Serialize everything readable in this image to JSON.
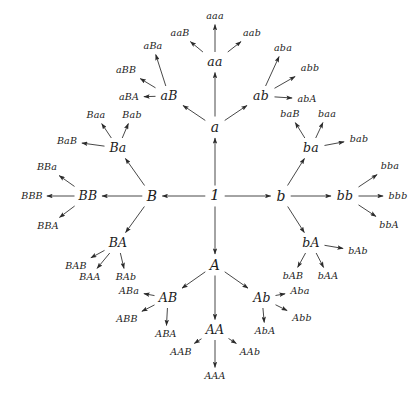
{
  "figure": {
    "type": "cayley-graph-tree",
    "generators": [
      "a",
      "b",
      "A",
      "B"
    ],
    "identity_label": "1",
    "line_color": "#333333",
    "text_color": "#1c1c1c",
    "background": "#ffffff",
    "width": 419,
    "height": 396
  },
  "nodes": [
    {
      "id": "root",
      "label": "1",
      "x": 215,
      "y": 196,
      "gen": 0
    },
    {
      "id": "a",
      "label": "a",
      "x": 215,
      "y": 127,
      "gen": 1
    },
    {
      "id": "b",
      "label": "b",
      "x": 281,
      "y": 196,
      "gen": 1
    },
    {
      "id": "A",
      "label": "A",
      "x": 215,
      "y": 265,
      "gen": 1
    },
    {
      "id": "B",
      "label": "B",
      "x": 152,
      "y": 196,
      "gen": 1
    },
    {
      "id": "aB",
      "label": "aB",
      "x": 169,
      "y": 96,
      "gen": 2
    },
    {
      "id": "aa",
      "label": "aa",
      "x": 215,
      "y": 62,
      "gen": 2
    },
    {
      "id": "ab",
      "label": "ab",
      "x": 261,
      "y": 96,
      "gen": 2
    },
    {
      "id": "ba",
      "label": "ba",
      "x": 311,
      "y": 148,
      "gen": 2
    },
    {
      "id": "bb",
      "label": "bb",
      "x": 345,
      "y": 196,
      "gen": 2
    },
    {
      "id": "bA",
      "label": "bA",
      "x": 311,
      "y": 243,
      "gen": 2
    },
    {
      "id": "AB",
      "label": "AB",
      "x": 168,
      "y": 298,
      "gen": 2
    },
    {
      "id": "AA",
      "label": "AA",
      "x": 215,
      "y": 330,
      "gen": 2
    },
    {
      "id": "Ab",
      "label": "Ab",
      "x": 262,
      "y": 298,
      "gen": 2
    },
    {
      "id": "Ba",
      "label": "Ba",
      "x": 118,
      "y": 148,
      "gen": 2
    },
    {
      "id": "BB",
      "label": "BB",
      "x": 88,
      "y": 196,
      "gen": 2
    },
    {
      "id": "BA",
      "label": "BA",
      "x": 118,
      "y": 243,
      "gen": 2
    },
    {
      "id": "aaB",
      "label": "aaB",
      "x": 180,
      "y": 33,
      "gen": 3
    },
    {
      "id": "aaa",
      "label": "aaa",
      "x": 215,
      "y": 16,
      "gen": 3
    },
    {
      "id": "aab",
      "label": "aab",
      "x": 252,
      "y": 33,
      "gen": 3
    },
    {
      "id": "aBB",
      "label": "aBB",
      "x": 126,
      "y": 70,
      "gen": 3
    },
    {
      "id": "aBa",
      "label": "aBa",
      "x": 153,
      "y": 46,
      "gen": 3
    },
    {
      "id": "aBA",
      "label": "aBA",
      "x": 129,
      "y": 97,
      "gen": 3
    },
    {
      "id": "aba",
      "label": "aba",
      "x": 283,
      "y": 48,
      "gen": 3
    },
    {
      "id": "abb",
      "label": "abb",
      "x": 310,
      "y": 68,
      "gen": 3
    },
    {
      "id": "abA",
      "label": "abA",
      "x": 307,
      "y": 99,
      "gen": 3
    },
    {
      "id": "baB",
      "label": "baB",
      "x": 290,
      "y": 114,
      "gen": 3
    },
    {
      "id": "baa",
      "label": "baa",
      "x": 327,
      "y": 114,
      "gen": 3
    },
    {
      "id": "bab",
      "label": "bab",
      "x": 359,
      "y": 139,
      "gen": 3
    },
    {
      "id": "bba",
      "label": "bba",
      "x": 390,
      "y": 166,
      "gen": 3
    },
    {
      "id": "bbb",
      "label": "bbb",
      "x": 398,
      "y": 196,
      "gen": 3
    },
    {
      "id": "bbA",
      "label": "bbA",
      "x": 389,
      "y": 225,
      "gen": 3
    },
    {
      "id": "bAb",
      "label": "bAb",
      "x": 358,
      "y": 251,
      "gen": 3
    },
    {
      "id": "bAB",
      "label": "bAB",
      "x": 293,
      "y": 276,
      "gen": 3
    },
    {
      "id": "bAA",
      "label": "bAA",
      "x": 328,
      "y": 276,
      "gen": 3
    },
    {
      "id": "Aba",
      "label": "Aba",
      "x": 300,
      "y": 291,
      "gen": 3
    },
    {
      "id": "Abb",
      "label": "Abb",
      "x": 302,
      "y": 318,
      "gen": 3
    },
    {
      "id": "AbA",
      "label": "AbA",
      "x": 265,
      "y": 331,
      "gen": 3
    },
    {
      "id": "AAB",
      "label": "AAB",
      "x": 181,
      "y": 352,
      "gen": 3
    },
    {
      "id": "AAA",
      "label": "AAA",
      "x": 215,
      "y": 376,
      "gen": 3
    },
    {
      "id": "AAb",
      "label": "AAb",
      "x": 250,
      "y": 352,
      "gen": 3
    },
    {
      "id": "ABa",
      "label": "ABa",
      "x": 129,
      "y": 291,
      "gen": 3
    },
    {
      "id": "ABB",
      "label": "ABB",
      "x": 127,
      "y": 319,
      "gen": 3
    },
    {
      "id": "ABA",
      "label": "ABA",
      "x": 166,
      "y": 334,
      "gen": 3
    },
    {
      "id": "BAB",
      "label": "BAB",
      "x": 76,
      "y": 266,
      "gen": 3
    },
    {
      "id": "BAA",
      "label": "BAA",
      "x": 90,
      "y": 277,
      "gen": 3
    },
    {
      "id": "BAb",
      "label": "BAb",
      "x": 126,
      "y": 277,
      "gen": 3
    },
    {
      "id": "BBa",
      "label": "BBa",
      "x": 47,
      "y": 167,
      "gen": 3
    },
    {
      "id": "BBB",
      "label": "BBB",
      "x": 32,
      "y": 196,
      "gen": 3
    },
    {
      "id": "BBA",
      "label": "BBA",
      "x": 48,
      "y": 226,
      "gen": 3
    },
    {
      "id": "Baa",
      "label": "Baa",
      "x": 96,
      "y": 115,
      "gen": 3
    },
    {
      "id": "Bab",
      "label": "Bab",
      "x": 132,
      "y": 115,
      "gen": 3
    },
    {
      "id": "BaB",
      "label": "BaB",
      "x": 67,
      "y": 141,
      "gen": 3
    }
  ],
  "edges": [
    {
      "from": "root",
      "to": "a"
    },
    {
      "from": "root",
      "to": "b"
    },
    {
      "from": "root",
      "to": "A"
    },
    {
      "from": "root",
      "to": "B"
    },
    {
      "from": "a",
      "to": "aB"
    },
    {
      "from": "a",
      "to": "aa"
    },
    {
      "from": "a",
      "to": "ab"
    },
    {
      "from": "b",
      "to": "ba"
    },
    {
      "from": "b",
      "to": "bb"
    },
    {
      "from": "b",
      "to": "bA"
    },
    {
      "from": "A",
      "to": "AB"
    },
    {
      "from": "A",
      "to": "AA"
    },
    {
      "from": "A",
      "to": "Ab"
    },
    {
      "from": "B",
      "to": "Ba"
    },
    {
      "from": "B",
      "to": "BB"
    },
    {
      "from": "B",
      "to": "BA"
    },
    {
      "from": "aa",
      "to": "aaB"
    },
    {
      "from": "aa",
      "to": "aaa"
    },
    {
      "from": "aa",
      "to": "aab"
    },
    {
      "from": "aB",
      "to": "aBB"
    },
    {
      "from": "aB",
      "to": "aBa"
    },
    {
      "from": "aB",
      "to": "aBA"
    },
    {
      "from": "ab",
      "to": "aba"
    },
    {
      "from": "ab",
      "to": "abb"
    },
    {
      "from": "ab",
      "to": "abA"
    },
    {
      "from": "ba",
      "to": "baB"
    },
    {
      "from": "ba",
      "to": "baa"
    },
    {
      "from": "ba",
      "to": "bab"
    },
    {
      "from": "bb",
      "to": "bba"
    },
    {
      "from": "bb",
      "to": "bbb"
    },
    {
      "from": "bb",
      "to": "bbA"
    },
    {
      "from": "bA",
      "to": "bAb"
    },
    {
      "from": "bA",
      "to": "bAB"
    },
    {
      "from": "bA",
      "to": "bAA"
    },
    {
      "from": "Ab",
      "to": "Aba"
    },
    {
      "from": "Ab",
      "to": "Abb"
    },
    {
      "from": "Ab",
      "to": "AbA"
    },
    {
      "from": "AA",
      "to": "AAB"
    },
    {
      "from": "AA",
      "to": "AAA"
    },
    {
      "from": "AA",
      "to": "AAb"
    },
    {
      "from": "AB",
      "to": "ABa"
    },
    {
      "from": "AB",
      "to": "ABB"
    },
    {
      "from": "AB",
      "to": "ABA"
    },
    {
      "from": "BA",
      "to": "BAB"
    },
    {
      "from": "BA",
      "to": "BAA"
    },
    {
      "from": "BA",
      "to": "BAb"
    },
    {
      "from": "BB",
      "to": "BBa"
    },
    {
      "from": "BB",
      "to": "BBB"
    },
    {
      "from": "BB",
      "to": "BBA"
    },
    {
      "from": "Ba",
      "to": "Baa"
    },
    {
      "from": "Ba",
      "to": "Bab"
    },
    {
      "from": "Ba",
      "to": "BaB"
    }
  ]
}
